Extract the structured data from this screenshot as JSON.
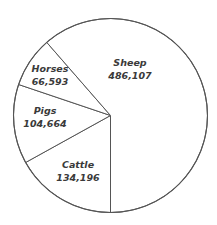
{
  "chart_data": {
    "type": "pie",
    "title": "",
    "slices": [
      {
        "label": "Sheep",
        "value": 486107,
        "value_text": "486,107"
      },
      {
        "label": "Cattle",
        "value": 134196,
        "value_text": "134,196"
      },
      {
        "label": "Pigs",
        "value": 104664,
        "value_text": "104,664"
      },
      {
        "label": "Horses",
        "value": 66593,
        "value_text": "66,593"
      }
    ],
    "legend": "none (labels inside slices)",
    "colors": {
      "fill": "#ffffff",
      "stroke": "#555555",
      "text": "#3a3a3a"
    }
  },
  "labels": {
    "sheep": {
      "name": "Sheep",
      "value": "486,107"
    },
    "horses": {
      "name": "Horses",
      "value": "66,593"
    },
    "pigs": {
      "name": "Pigs",
      "value": "104,664"
    },
    "cattle": {
      "name": "Cattle",
      "value": "134,196"
    }
  }
}
